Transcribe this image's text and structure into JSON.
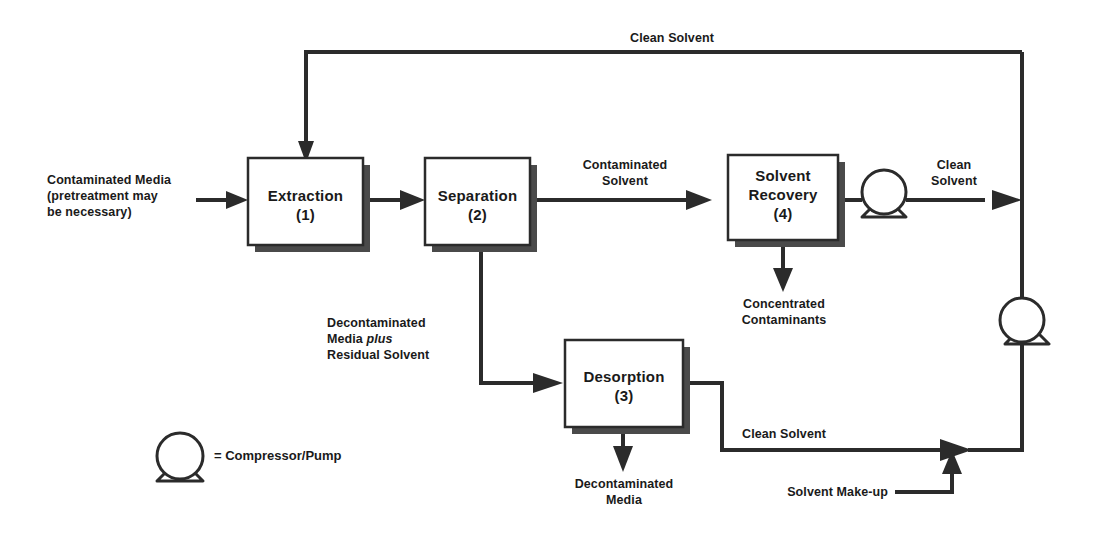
{
  "diagram": {
    "type": "process-flow-diagram",
    "line_color": "#2b2b2b",
    "box_fill": "#ffffff",
    "shadow_color": "#4a4a4a",
    "background": "#ffffff"
  },
  "nodes": [
    {
      "id": "extraction",
      "name": "Extraction",
      "number": "(1)"
    },
    {
      "id": "separation",
      "name": "Separation",
      "number": "(2)"
    },
    {
      "id": "desorption",
      "name": "Desorption",
      "number": "(3)"
    },
    {
      "id": "solvent_recovery",
      "name": "Solvent Recovery",
      "number": "(4)",
      "line1": "Solvent",
      "line2": "Recovery"
    }
  ],
  "streams": {
    "feed_line1": "Contaminated Media",
    "feed_line2": "(pretreatment may",
    "feed_line3": "be necessary)",
    "clean_solvent_top": "Clean Solvent",
    "contaminated_solvent_line1": "Contaminated",
    "contaminated_solvent_line2": "Solvent",
    "clean_solvent_out_line1": "Clean",
    "clean_solvent_out_line2": "Solvent",
    "concentrated_line1": "Concentrated",
    "concentrated_line2": "Contaminants",
    "decon_media_solvent_line1": "Decontaminated",
    "decon_media_solvent_line2a": "Media ",
    "decon_media_solvent_line2b": "plus",
    "decon_media_solvent_line3": "Residual Solvent",
    "decontaminated_media_line1": "Decontaminated",
    "decontaminated_media_line2": "Media",
    "clean_solvent_bottom": "Clean Solvent",
    "solvent_makeup": "Solvent Make-up"
  },
  "legend": {
    "symbol": "pump-icon",
    "text": "= Compressor/Pump"
  }
}
